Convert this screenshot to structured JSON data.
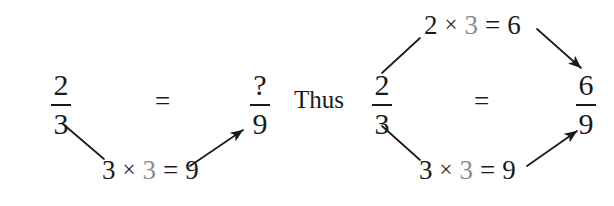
{
  "figure": {
    "type": "equivalent-fractions-diagram",
    "stroke_color": "#1a1a1a",
    "dim_color": "#8c8c8c",
    "background": "#ffffff",
    "connector_word": "Thus"
  },
  "left_group": {
    "source_fraction": {
      "numerator": "2",
      "denominator": "3"
    },
    "equals": "=",
    "target_fraction": {
      "numerator": "?",
      "denominator": "9"
    },
    "bottom_expression": {
      "a": "3",
      "times": "×",
      "b": "3",
      "eq": "=",
      "result": "9"
    }
  },
  "right_group": {
    "source_fraction": {
      "numerator": "2",
      "denominator": "3"
    },
    "equals": "=",
    "target_fraction": {
      "numerator": "6",
      "denominator": "9"
    },
    "top_expression": {
      "a": "2",
      "times": "×",
      "b": "3",
      "eq": "=",
      "result": "6"
    },
    "bottom_expression": {
      "a": "3",
      "times": "×",
      "b": "3",
      "eq": "=",
      "result": "9"
    }
  }
}
